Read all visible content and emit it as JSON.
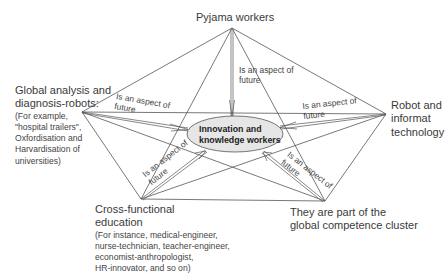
{
  "diagram": {
    "center": {
      "line1": "Innovation and",
      "line2": "knowledge workers",
      "fill": "#e6e6e6"
    },
    "nodes": {
      "pyjama": {
        "title": "Pyjama workers"
      },
      "robot": {
        "line1": "Robot and",
        "line2": "informat",
        "line3": "technology"
      },
      "global": {
        "line1": "Global analysis and",
        "line2": "diagnosis-robots:",
        "detail1": "(For example,",
        "detail2": "\"hospital trailers\",",
        "detail3": "Oxfordisation and",
        "detail4": "Harvardisation of",
        "detail5": "universities)"
      },
      "cross": {
        "line1": "Cross-functional",
        "line2": "education",
        "detail1": "(For instance, medical-engineer,",
        "detail2": "nurse-technician, teacher-engineer,",
        "detail3": "economist-anthropologist,",
        "detail4": "HR-innovator, and so on)"
      },
      "cluster": {
        "line1": "They are part of the",
        "line2": "global competence cluster"
      }
    },
    "edge_labels": {
      "top": {
        "line1": "Is an aspect of",
        "line2": "future"
      },
      "left": {
        "line1": "Is an aspect of",
        "line2": "future"
      },
      "right": {
        "line1": "Is an aspect of",
        "line2": "future"
      },
      "bottom_left": {
        "line1": "Is an aspect of",
        "line2": "future"
      },
      "bottom_right": {
        "line1": "Is an aspect of",
        "line2": "future"
      }
    },
    "line_color": "#555555"
  }
}
